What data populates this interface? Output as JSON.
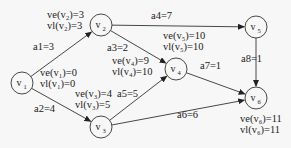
{
  "diagram": {
    "type": "AOE network (activity on edge) with earliest/latest event times",
    "nodes": [
      {
        "id": "v1",
        "label": "v",
        "sub": "1",
        "x": 22,
        "y": 83,
        "ve": "ve(v₁)=0",
        "vl": "vl(v₁)=0"
      },
      {
        "id": "v2",
        "label": "v",
        "sub": "2",
        "x": 101,
        "y": 25,
        "ve": "ve(v₂)=3",
        "vl": "vl(v₂)=3"
      },
      {
        "id": "v3",
        "label": "v",
        "sub": "3",
        "x": 101,
        "y": 127,
        "ve": "ve(v₃)=4",
        "vl": "vl(v₃)=5"
      },
      {
        "id": "v4",
        "label": "v",
        "sub": "4",
        "x": 176,
        "y": 69,
        "ve": "ve(v₄)=9",
        "vl": "vl(v₄)=10"
      },
      {
        "id": "v5",
        "label": "v",
        "sub": "5",
        "x": 256,
        "y": 27,
        "ve": "ve(v₅)=10",
        "vl": "vl(v₅)=10"
      },
      {
        "id": "v6",
        "label": "v",
        "sub": "6",
        "x": 256,
        "y": 98,
        "ve": "ve(v₆)=11",
        "vl": "vl(v₆)=11"
      }
    ],
    "edges": [
      {
        "from": "v1",
        "to": "v2",
        "label": "a1=3"
      },
      {
        "from": "v1",
        "to": "v3",
        "label": "a2=4"
      },
      {
        "from": "v2",
        "to": "v4",
        "label": "a3=2"
      },
      {
        "from": "v2",
        "to": "v5",
        "label": "a4=7"
      },
      {
        "from": "v3",
        "to": "v4",
        "label": "a5=5"
      },
      {
        "from": "v3",
        "to": "v6",
        "label": "a6=6"
      },
      {
        "from": "v4",
        "to": "v6",
        "label": "a7=1"
      },
      {
        "from": "v5",
        "to": "v6",
        "label": "a8=1"
      }
    ]
  },
  "labels": {
    "v1_ve": "ve(v₁)=0",
    "v1_vl": "vl(v₁)=0",
    "v2_ve": "ve(v₂)=3",
    "v2_vl": "vl(v₂)=3",
    "v3_ve": "ve(v₃)=4",
    "v3_vl": "vl(v₃)=5",
    "v4_ve": "ve(v₄)=9",
    "v4_vl": "vl(v₄)=10",
    "v5_ve": "ve(v₅)=10",
    "v5_vl": "vl(v₅)=10",
    "v6_ve": "ve(v₆)=11",
    "v6_vl": "vl(v₆)=11",
    "a1": "a1=3",
    "a2": "a2=4",
    "a3": "a3=2",
    "a4": "a4=7",
    "a5": "a5=5",
    "a6": "a6=6",
    "a7": "a7=1",
    "a8": "a8=1"
  },
  "colors": {
    "stroke": "#333333",
    "background": "#f7f7f7"
  }
}
